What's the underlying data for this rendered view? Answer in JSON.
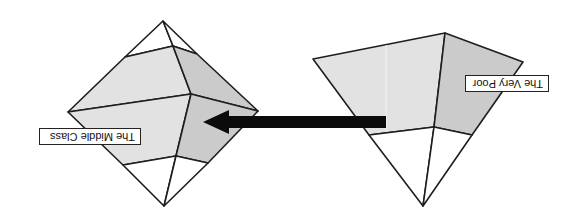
{
  "diagram": {
    "orientation": "rotated 180 degrees (upside-down)",
    "colors": {
      "background": "#ffffff",
      "stroke": "#1e1e1e",
      "face_light": "#e2e2e2",
      "face_dark": "#c9c9c9",
      "face_white": "#ffffff",
      "arrow": "#0b0b0b"
    },
    "shapes": [
      {
        "id": "middle-class-shape",
        "type": "octahedron / diamond",
        "label": "The Middle Class"
      },
      {
        "id": "very-poor-shape",
        "type": "inverted pyramid",
        "label": "The Very Poor"
      }
    ],
    "arrow": {
      "from": "very-poor-shape",
      "to": "middle-class-shape",
      "direction": "left"
    }
  }
}
